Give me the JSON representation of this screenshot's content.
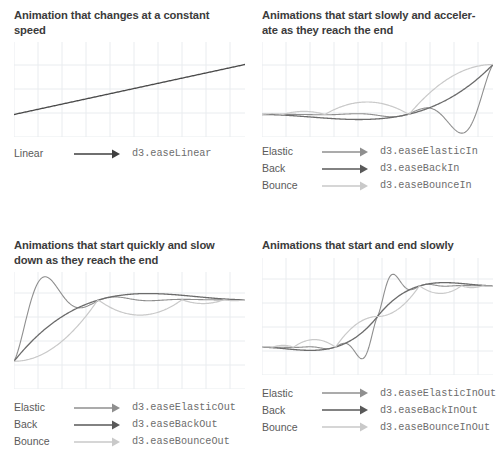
{
  "page": {
    "background": "#ffffff",
    "title_color": "#3b3b3b",
    "label_color": "#5a5a5a",
    "code_color": "#6d6d6d",
    "grid_color": "#e9ecef"
  },
  "series_colors": {
    "linear": "#4a4a4a",
    "elastic": "#8f8f8f",
    "back": "#6b6b6b",
    "bounce": "#c9c9c9"
  },
  "panels": [
    {
      "id": "constant-speed",
      "title": "Animation that changes at a constant\nspeed",
      "legend": [
        {
          "label": "Linear",
          "code": "d3.easeLinear",
          "color": "#3f3f3f",
          "arrow": "arrow-icon"
        }
      ]
    },
    {
      "id": "ease-in",
      "title": "Animations that start slowly and acceler-\nate as they reach the end",
      "legend": [
        {
          "label": "Elastic",
          "code": "d3.easeElasticIn",
          "color": "#8f8f8f",
          "arrow": "arrow-icon"
        },
        {
          "label": "Back",
          "code": "d3.easeBackIn",
          "color": "#595959",
          "arrow": "arrow-icon"
        },
        {
          "label": "Bounce",
          "code": "d3.easeBounceIn",
          "color": "#c9c9c9",
          "arrow": "arrow-icon"
        }
      ]
    },
    {
      "id": "ease-out",
      "title": "Animations that start quickly and slow\ndown as they reach the end",
      "legend": [
        {
          "label": "Elastic",
          "code": "d3.easeElasticOut",
          "color": "#8f8f8f",
          "arrow": "arrow-icon"
        },
        {
          "label": "Back",
          "code": "d3.easeBackOut",
          "color": "#595959",
          "arrow": "arrow-icon"
        },
        {
          "label": "Bounce",
          "code": "d3.easeBounceOut",
          "color": "#c9c9c9",
          "arrow": "arrow-icon"
        }
      ]
    },
    {
      "id": "ease-in-out",
      "title": "Animations that start and end slowly",
      "legend": [
        {
          "label": "Elastic",
          "code": "d3.easeElasticInOut",
          "color": "#8f8f8f",
          "arrow": "arrow-icon"
        },
        {
          "label": "Back",
          "code": "d3.easeBackInOut",
          "color": "#595959",
          "arrow": "arrow-icon"
        },
        {
          "label": "Bounce",
          "code": "d3.easeBounceInOut",
          "color": "#c9c9c9",
          "arrow": "arrow-icon"
        }
      ]
    }
  ],
  "chart_data": [
    {
      "type": "line",
      "id": "constant-speed",
      "title": "Animation that changes at a constant speed",
      "xlabel": "",
      "ylabel": "",
      "xlim": [
        0,
        1
      ],
      "ylim": [
        -0.45,
        1.45
      ],
      "grid": true,
      "legend_position": "below",
      "series": [
        {
          "name": "d3.easeLinear",
          "easing": "linear",
          "color": "#4a4a4a",
          "width": 1.3
        }
      ]
    },
    {
      "type": "line",
      "id": "ease-in",
      "title": "Animations that start slowly and accelerate as they reach the end",
      "xlabel": "",
      "ylabel": "",
      "xlim": [
        0,
        1
      ],
      "ylim": [
        -0.45,
        1.45
      ],
      "grid": true,
      "legend_position": "below",
      "series": [
        {
          "name": "d3.easeElasticIn",
          "easing": "elasticIn",
          "color": "#8f8f8f",
          "width": 1.1
        },
        {
          "name": "d3.easeBackIn",
          "easing": "backIn",
          "color": "#6b6b6b",
          "width": 1.3
        },
        {
          "name": "d3.easeBounceIn",
          "easing": "bounceIn",
          "color": "#c9c9c9",
          "width": 1.2
        }
      ]
    },
    {
      "type": "line",
      "id": "ease-out",
      "title": "Animations that start quickly and slow down as they reach the end",
      "xlabel": "",
      "ylabel": "",
      "xlim": [
        0,
        1
      ],
      "ylim": [
        -0.45,
        1.45
      ],
      "grid": true,
      "legend_position": "below",
      "series": [
        {
          "name": "d3.easeElasticOut",
          "easing": "elasticOut",
          "color": "#8f8f8f",
          "width": 1.1
        },
        {
          "name": "d3.easeBackOut",
          "easing": "backOut",
          "color": "#6b6b6b",
          "width": 1.3
        },
        {
          "name": "d3.easeBounceOut",
          "easing": "bounceOut",
          "color": "#c9c9c9",
          "width": 1.2
        }
      ]
    },
    {
      "type": "line",
      "id": "ease-in-out",
      "title": "Animations that start and end slowly",
      "xlabel": "",
      "ylabel": "",
      "xlim": [
        0,
        1
      ],
      "ylim": [
        -0.45,
        1.45
      ],
      "grid": true,
      "legend_position": "below",
      "series": [
        {
          "name": "d3.easeElasticInOut",
          "easing": "elasticInOut",
          "color": "#8f8f8f",
          "width": 1.1
        },
        {
          "name": "d3.easeBackInOut",
          "easing": "backInOut",
          "color": "#6b6b6b",
          "width": 1.3
        },
        {
          "name": "d3.easeBounceInOut",
          "easing": "bounceInOut",
          "color": "#c9c9c9",
          "width": 1.2
        }
      ]
    }
  ]
}
